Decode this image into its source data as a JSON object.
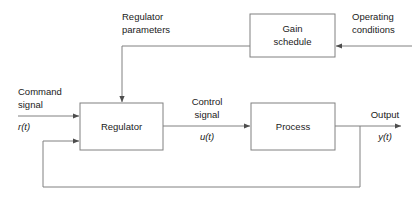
{
  "diagram": {
    "colors": {
      "line": "#808080",
      "text": "#1a1a1a",
      "background": "#ffffff",
      "block_fill": "#ffffff"
    },
    "blocks": [
      {
        "id": "regulator",
        "label": "Regulator",
        "x": 80,
        "y": 103,
        "w": 83,
        "h": 47
      },
      {
        "id": "process",
        "label": "Process",
        "x": 251,
        "y": 103,
        "w": 84,
        "h": 47
      },
      {
        "id": "gain_schedule",
        "label_line1": "Gain",
        "label_line2": "schedule",
        "x": 250,
        "y": 14,
        "w": 85,
        "h": 43
      }
    ],
    "signals": {
      "command": {
        "line1": "Command",
        "line2": "signal",
        "variable": "r(t)"
      },
      "control": {
        "line1": "Control",
        "line2": "signal",
        "variable": "u(t)"
      },
      "output": {
        "line1": "Output",
        "variable": "y(t)"
      },
      "regulator_parameters": {
        "line1": "Regulator",
        "line2": "parameters"
      },
      "operating_conditions": {
        "line1": "Operating",
        "line2": "conditions"
      }
    }
  }
}
